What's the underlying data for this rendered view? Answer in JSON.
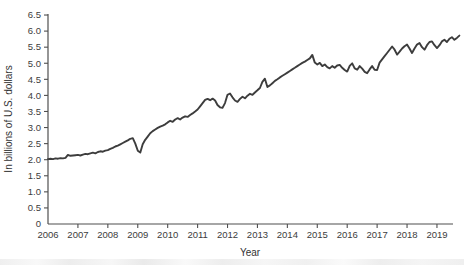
{
  "chart_data": {
    "type": "line",
    "title": "",
    "xlabel": "Year",
    "ylabel": "In billions of U.S. dollars",
    "legend": "none",
    "grid": false,
    "line_color": "#3d3d3d",
    "axis_color": "#4f4f4f",
    "text_color": "#3c3c3c",
    "xlim": [
      2006,
      2019.85
    ],
    "ylim": [
      0,
      6.5
    ],
    "x_tick_years": [
      2006,
      2007,
      2008,
      2009,
      2010,
      2011,
      2012,
      2013,
      2014,
      2015,
      2016,
      2017,
      2018,
      2019
    ],
    "y_tick_values": [
      0,
      0.5,
      1.0,
      1.5,
      2.0,
      2.5,
      3.0,
      3.5,
      4.0,
      4.5,
      5.0,
      5.5,
      6.0,
      6.5
    ],
    "origin_label": "0",
    "x_start_year": 2006,
    "points_per_year": 12,
    "values": [
      2.02,
      2.03,
      2.02,
      2.04,
      2.03,
      2.05,
      2.04,
      2.06,
      2.15,
      2.12,
      2.13,
      2.14,
      2.15,
      2.13,
      2.16,
      2.18,
      2.17,
      2.2,
      2.22,
      2.2,
      2.24,
      2.26,
      2.25,
      2.28,
      2.3,
      2.34,
      2.37,
      2.41,
      2.44,
      2.48,
      2.52,
      2.56,
      2.6,
      2.65,
      2.67,
      2.5,
      2.28,
      2.22,
      2.48,
      2.62,
      2.72,
      2.82,
      2.89,
      2.94,
      2.99,
      3.03,
      3.06,
      3.1,
      3.16,
      3.21,
      3.18,
      3.25,
      3.29,
      3.25,
      3.31,
      3.35,
      3.33,
      3.39,
      3.44,
      3.5,
      3.56,
      3.66,
      3.76,
      3.86,
      3.89,
      3.85,
      3.9,
      3.84,
      3.7,
      3.63,
      3.61,
      3.76,
      4.02,
      4.06,
      3.94,
      3.84,
      3.8,
      3.89,
      3.96,
      3.91,
      3.99,
      4.05,
      4.02,
      4.09,
      4.16,
      4.23,
      4.42,
      4.52,
      4.26,
      4.31,
      4.38,
      4.45,
      4.5,
      4.56,
      4.61,
      4.66,
      4.71,
      4.76,
      4.81,
      4.86,
      4.91,
      4.96,
      5.01,
      5.05,
      5.1,
      5.15,
      5.26,
      5.02,
      4.96,
      5.01,
      4.91,
      4.96,
      4.88,
      4.84,
      4.91,
      4.86,
      4.93,
      4.95,
      4.86,
      4.79,
      4.74,
      4.92,
      5.0,
      4.84,
      4.8,
      4.91,
      4.83,
      4.73,
      4.69,
      4.81,
      4.91,
      4.8,
      4.79,
      5.02,
      5.12,
      5.22,
      5.32,
      5.42,
      5.52,
      5.42,
      5.27,
      5.36,
      5.46,
      5.53,
      5.58,
      5.46,
      5.32,
      5.46,
      5.58,
      5.63,
      5.5,
      5.42,
      5.56,
      5.66,
      5.68,
      5.56,
      5.47,
      5.56,
      5.68,
      5.73,
      5.66,
      5.76,
      5.81,
      5.73,
      5.79,
      5.86
    ]
  }
}
